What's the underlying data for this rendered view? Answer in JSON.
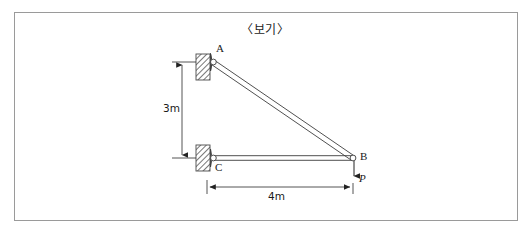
{
  "figure": {
    "title": "〈보기〉",
    "frame": {
      "border_color": "#9a9a9a",
      "background": "#ffffff"
    }
  },
  "diagram": {
    "type": "truss-free-body-diagram",
    "line_color": "#3c3c3c",
    "joints": [
      {
        "id": "A",
        "label": "A",
        "x": 212,
        "y": 62,
        "support": "pinned"
      },
      {
        "id": "B",
        "label": "B",
        "x": 353,
        "y": 158,
        "support": "none"
      },
      {
        "id": "C",
        "label": "C",
        "x": 212,
        "y": 158,
        "support": "pinned"
      }
    ],
    "members": [
      {
        "name": "member-AB",
        "from": "A",
        "to": "B"
      },
      {
        "name": "member-CB",
        "from": "C",
        "to": "B"
      }
    ],
    "supports": [
      {
        "name": "support-A",
        "joint": "A",
        "kind": "hinge-wall",
        "wall_x": 196,
        "wall_y": 54,
        "wall_w": 14,
        "wall_h": 26
      },
      {
        "name": "support-C",
        "joint": "C",
        "kind": "hinge-wall",
        "wall_x": 196,
        "wall_y": 145,
        "wall_w": 14,
        "wall_h": 26
      }
    ],
    "loads": [
      {
        "name": "load-P",
        "label": "P",
        "joint": "B",
        "direction": "down",
        "tip_y": 181
      }
    ],
    "dimensions": [
      {
        "name": "dimension-vertical",
        "label": "3m",
        "orientation": "vertical",
        "value": 3,
        "unit": "m",
        "from_y": 62,
        "to_y": 158,
        "line_x": 182
      },
      {
        "name": "dimension-horizontal",
        "label": "4m",
        "orientation": "horizontal",
        "value": 4,
        "unit": "m",
        "from_x": 207,
        "to_x": 353,
        "line_y": 187
      }
    ]
  }
}
